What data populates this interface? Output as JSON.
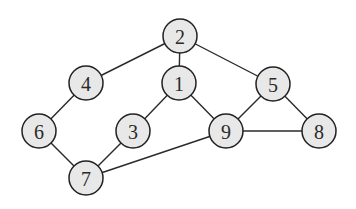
{
  "diagram": {
    "type": "undirected-graph",
    "nodes": [
      {
        "id": "2",
        "label": "2"
      },
      {
        "id": "4",
        "label": "4"
      },
      {
        "id": "1",
        "label": "1"
      },
      {
        "id": "5",
        "label": "5"
      },
      {
        "id": "6",
        "label": "6"
      },
      {
        "id": "3",
        "label": "3"
      },
      {
        "id": "9",
        "label": "9"
      },
      {
        "id": "8",
        "label": "8"
      },
      {
        "id": "7",
        "label": "7"
      }
    ],
    "edges": [
      {
        "from": "2",
        "to": "4"
      },
      {
        "from": "2",
        "to": "1"
      },
      {
        "from": "2",
        "to": "5"
      },
      {
        "from": "4",
        "to": "6"
      },
      {
        "from": "6",
        "to": "7"
      },
      {
        "from": "7",
        "to": "3"
      },
      {
        "from": "3",
        "to": "1"
      },
      {
        "from": "1",
        "to": "9"
      },
      {
        "from": "5",
        "to": "9"
      },
      {
        "from": "5",
        "to": "8"
      },
      {
        "from": "9",
        "to": "8"
      },
      {
        "from": "9",
        "to": "7"
      }
    ],
    "colors": {
      "node_fill": "#e8e8e8",
      "node_stroke": "#222222",
      "edge": "#2a2a2a",
      "label": "#2a2a2a"
    }
  }
}
